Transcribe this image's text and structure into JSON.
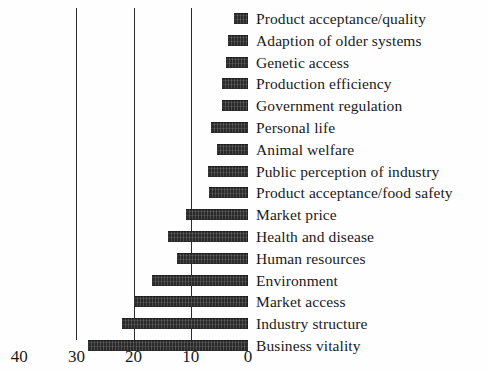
{
  "chart_data": {
    "type": "bar",
    "orientation": "horizontal",
    "title": "",
    "subtitle": "",
    "xlabel": "",
    "ylabel": "",
    "xlim": [
      40,
      0
    ],
    "x_axis_reversed": true,
    "grid": true,
    "gridlines_at": [
      30,
      20,
      10
    ],
    "legend": "none",
    "legend_position": "right-as-category-labels",
    "bar_color": "#2a2a2a",
    "axis_color": "#2b2b2b",
    "tick_labels": [
      "40",
      "30",
      "20",
      "10",
      "0"
    ],
    "tick_values": [
      40,
      30,
      20,
      10,
      0
    ],
    "categories": [
      "Product acceptance/quality",
      "Adaption of older systems",
      "Genetic access",
      "Production efficiency",
      "Government regulation",
      "Personal life",
      "Animal welfare",
      "Public perception of industry",
      "Product acceptance/food safety",
      "Market price",
      "Health and disease",
      "Human resources",
      "Environment",
      "Market access",
      "Industry structure",
      "Business vitality"
    ],
    "values": [
      2.5,
      3.5,
      3.8,
      4.5,
      4.6,
      6.5,
      5.5,
      7.0,
      6.8,
      10.9,
      13.9,
      12.5,
      16.7,
      20.0,
      22.0,
      28.0
    ]
  }
}
